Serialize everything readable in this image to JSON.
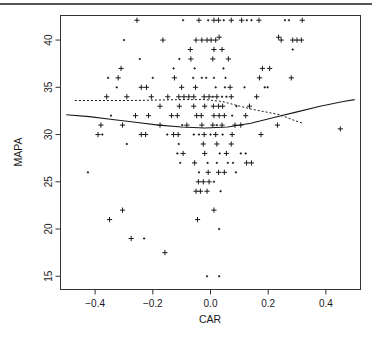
{
  "figure": {
    "name": "mapa-vs-car-scatterplot",
    "background": "#ffffff",
    "foreground": "#1a1a1a",
    "top_rule_color": "#555555"
  },
  "chart_data": {
    "type": "scatter",
    "title": "",
    "subtitle": "",
    "xlabel": "CAR",
    "ylabel": "MAPA",
    "xlim": [
      -0.52,
      0.52
    ],
    "ylim": [
      13.6,
      42.6
    ],
    "xticks": [
      -0.4,
      -0.2,
      0.0,
      0.2,
      0.4
    ],
    "xticklabels": [
      "-0.4",
      "-0.2",
      "0.0",
      "0.2",
      "0.4"
    ],
    "yticks": [
      15,
      20,
      25,
      30,
      35,
      40
    ],
    "yticklabels": [
      "15",
      "20",
      "25",
      "30",
      "35",
      "40"
    ],
    "grid": false,
    "legend": null,
    "marker": "plus",
    "frame": "box",
    "series": [
      {
        "name": "observations",
        "marker": "+",
        "color": "#1a1a1a",
        "points": [
          [
            -0.255,
            42.1
          ],
          [
            -0.095,
            42.1
          ],
          [
            -0.04,
            42.1
          ],
          [
            -0.008,
            42.1
          ],
          [
            0.012,
            42.1
          ],
          [
            0.028,
            42.1
          ],
          [
            0.046,
            42.1
          ],
          [
            0.072,
            42.1
          ],
          [
            0.108,
            42.1
          ],
          [
            0.126,
            42.1
          ],
          [
            0.142,
            42.1
          ],
          [
            0.168,
            42.1
          ],
          [
            0.258,
            42.1
          ],
          [
            0.272,
            42.1
          ],
          [
            0.318,
            42.1
          ],
          [
            -0.165,
            40.0
          ],
          [
            0.03,
            40.3
          ],
          [
            0.236,
            40.3
          ],
          [
            -0.3,
            40.0
          ],
          [
            -0.05,
            40.0
          ],
          [
            -0.03,
            40.0
          ],
          [
            -0.012,
            40.0
          ],
          [
            0.002,
            40.0
          ],
          [
            0.018,
            40.0
          ],
          [
            0.245,
            40.0
          ],
          [
            0.285,
            40.0
          ],
          [
            0.3,
            40.0
          ],
          [
            0.315,
            40.0
          ],
          [
            -0.07,
            39.0
          ],
          [
            0.012,
            39.0
          ],
          [
            0.04,
            39.0
          ],
          [
            0.285,
            39.0
          ],
          [
            -0.245,
            38.0
          ],
          [
            -0.108,
            38.0
          ],
          [
            -0.068,
            38.0
          ],
          [
            0.008,
            38.0
          ],
          [
            0.062,
            38.0
          ],
          [
            -0.31,
            37.0
          ],
          [
            -0.128,
            37.0
          ],
          [
            -0.055,
            37.0
          ],
          [
            0.045,
            37.0
          ],
          [
            0.18,
            37.0
          ],
          [
            0.205,
            37.0
          ],
          [
            -0.355,
            36.0
          ],
          [
            -0.32,
            36.0
          ],
          [
            -0.2,
            36.0
          ],
          [
            -0.125,
            36.0
          ],
          [
            -0.06,
            36.0
          ],
          [
            -0.03,
            36.0
          ],
          [
            -0.015,
            36.0
          ],
          [
            0.012,
            36.0
          ],
          [
            0.052,
            36.0
          ],
          [
            0.17,
            36.0
          ],
          [
            0.28,
            36.0
          ],
          [
            -0.325,
            35.0
          ],
          [
            -0.24,
            35.0
          ],
          [
            -0.222,
            35.0
          ],
          [
            -0.1,
            35.0
          ],
          [
            -0.052,
            35.0
          ],
          [
            0.018,
            35.0
          ],
          [
            0.05,
            35.0
          ],
          [
            0.068,
            35.0
          ],
          [
            0.118,
            35.0
          ],
          [
            0.188,
            35.0
          ],
          [
            0.198,
            35.0
          ],
          [
            -0.36,
            34.0
          ],
          [
            -0.29,
            34.0
          ],
          [
            -0.205,
            34.0
          ],
          [
            -0.148,
            34.0
          ],
          [
            -0.11,
            34.0
          ],
          [
            -0.092,
            34.0
          ],
          [
            -0.075,
            34.0
          ],
          [
            -0.058,
            34.0
          ],
          [
            -0.022,
            34.0
          ],
          [
            -0.005,
            34.0
          ],
          [
            0.008,
            34.0
          ],
          [
            0.022,
            34.0
          ],
          [
            0.04,
            34.0
          ],
          [
            0.055,
            34.0
          ],
          [
            0.072,
            34.0
          ],
          [
            0.16,
            34.0
          ],
          [
            -0.175,
            33.0
          ],
          [
            -0.108,
            33.0
          ],
          [
            -0.058,
            33.0
          ],
          [
            -0.02,
            33.0
          ],
          [
            0.01,
            33.0
          ],
          [
            0.028,
            33.0
          ],
          [
            0.042,
            33.0
          ],
          [
            0.09,
            33.0
          ],
          [
            0.135,
            33.0
          ],
          [
            -0.345,
            32.0
          ],
          [
            -0.26,
            32.0
          ],
          [
            -0.215,
            32.0
          ],
          [
            -0.135,
            32.0
          ],
          [
            -0.115,
            32.0
          ],
          [
            -0.048,
            32.0
          ],
          [
            -0.032,
            32.0
          ],
          [
            0.012,
            32.0
          ],
          [
            0.03,
            32.0
          ],
          [
            0.048,
            32.0
          ],
          [
            0.075,
            32.0
          ],
          [
            0.122,
            32.0
          ],
          [
            -0.38,
            31.0
          ],
          [
            -0.305,
            31.0
          ],
          [
            -0.175,
            31.0
          ],
          [
            -0.098,
            31.0
          ],
          [
            -0.082,
            31.0
          ],
          [
            -0.03,
            31.0
          ],
          [
            0.008,
            31.0
          ],
          [
            0.022,
            31.0
          ],
          [
            0.04,
            31.0
          ],
          [
            0.085,
            31.0
          ],
          [
            0.105,
            31.0
          ],
          [
            0.232,
            31.0
          ],
          [
            0.45,
            30.6
          ],
          [
            -0.39,
            30.0
          ],
          [
            -0.375,
            30.0
          ],
          [
            -0.24,
            30.0
          ],
          [
            -0.225,
            30.0
          ],
          [
            -0.15,
            30.0
          ],
          [
            -0.128,
            30.0
          ],
          [
            -0.112,
            30.0
          ],
          [
            -0.058,
            30.0
          ],
          [
            -0.04,
            30.0
          ],
          [
            -0.022,
            30.0
          ],
          [
            0.0,
            30.0
          ],
          [
            0.018,
            30.0
          ],
          [
            0.042,
            30.0
          ],
          [
            0.075,
            30.0
          ],
          [
            0.175,
            30.0
          ],
          [
            -0.29,
            29.0
          ],
          [
            -0.11,
            29.0
          ],
          [
            -0.025,
            29.0
          ],
          [
            0.022,
            29.0
          ],
          [
            0.072,
            29.0
          ],
          [
            -0.115,
            28.0
          ],
          [
            -0.095,
            28.0
          ],
          [
            -0.02,
            28.0
          ],
          [
            0.032,
            28.0
          ],
          [
            0.055,
            28.0
          ],
          [
            0.105,
            28.0
          ],
          [
            0.122,
            28.0
          ],
          [
            -0.105,
            27.0
          ],
          [
            -0.055,
            27.0
          ],
          [
            -0.01,
            27.0
          ],
          [
            0.022,
            27.0
          ],
          [
            0.06,
            27.0
          ],
          [
            0.078,
            27.0
          ],
          [
            0.125,
            27.0
          ],
          [
            0.142,
            27.0
          ],
          [
            -0.425,
            26.0
          ],
          [
            -0.04,
            26.0
          ],
          [
            -0.008,
            26.0
          ],
          [
            0.028,
            26.0
          ],
          [
            0.048,
            26.0
          ],
          [
            0.088,
            26.0
          ],
          [
            -0.042,
            25.0
          ],
          [
            -0.025,
            25.0
          ],
          [
            -0.005,
            25.0
          ],
          [
            0.012,
            25.0
          ],
          [
            -0.05,
            24.0
          ],
          [
            -0.035,
            24.0
          ],
          [
            -0.012,
            24.0
          ],
          [
            0.035,
            24.0
          ],
          [
            -0.305,
            22.0
          ],
          [
            0.012,
            22.0
          ],
          [
            -0.35,
            21.0
          ],
          [
            -0.045,
            21.0
          ],
          [
            -0.275,
            19.0
          ],
          [
            -0.23,
            19.0
          ],
          [
            0.03,
            20.0
          ],
          [
            -0.012,
            15.0
          ],
          [
            0.03,
            15.0
          ],
          [
            -0.158,
            17.5
          ]
        ]
      }
    ],
    "fitted_curves": [
      {
        "name": "lowess-solid",
        "style": "solid",
        "color": "#1a1a1a",
        "points": [
          [
            -0.5,
            32.1
          ],
          [
            -0.42,
            31.9
          ],
          [
            -0.34,
            31.6
          ],
          [
            -0.26,
            31.3
          ],
          [
            -0.18,
            31.0
          ],
          [
            -0.1,
            30.8
          ],
          [
            -0.02,
            30.7
          ],
          [
            0.06,
            30.8
          ],
          [
            0.14,
            31.2
          ],
          [
            0.22,
            31.8
          ],
          [
            0.3,
            32.4
          ],
          [
            0.38,
            33.0
          ],
          [
            0.46,
            33.5
          ],
          [
            0.5,
            33.7
          ]
        ]
      },
      {
        "name": "lowess-dotted",
        "style": "dotted",
        "color": "#1a1a1a",
        "points": [
          [
            -0.47,
            33.6
          ],
          [
            -0.38,
            33.6
          ],
          [
            -0.28,
            33.6
          ],
          [
            -0.18,
            33.65
          ],
          [
            -0.1,
            33.7
          ],
          [
            -0.02,
            33.7
          ],
          [
            0.04,
            33.5
          ],
          [
            0.09,
            33.1
          ],
          [
            0.14,
            32.7
          ],
          [
            0.19,
            32.4
          ],
          [
            0.24,
            32.1
          ],
          [
            0.29,
            31.5
          ],
          [
            0.32,
            31.2
          ]
        ]
      }
    ]
  },
  "axes": {
    "x_axis_title": "CAR",
    "y_axis_title": "MAPA"
  }
}
